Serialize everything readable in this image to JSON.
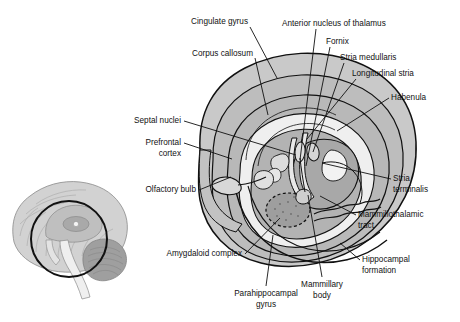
{
  "figure": {
    "background_color": "#ffffff",
    "line_color": "#111111",
    "label_font_size_px": 8.2,
    "palette": {
      "outer_cortex_fill": "#c9c9c9",
      "mid_band_fill": "#bdbdbd",
      "inner_band_fill": "#b3b3b3",
      "thalamus_fill": "#a8a8a8",
      "amygdala_fill": "#9e9e9e",
      "white_fill": "#f2f2f2",
      "inset_brain_fill": "#d2d2d2",
      "inset_deep_fill": "#a9a9a9",
      "inset_circle_stroke": "#111111"
    }
  },
  "inset": {
    "name": "orientation-inset",
    "description": "Mid-sagittal whole brain with circle marking the limbic region"
  },
  "labels": [
    {
      "id": "cingulate-gyrus",
      "text": "Cingulate gyrus",
      "lines": [
        "Cingulate gyrus"
      ],
      "anchor": "end",
      "x": 248,
      "y": 24,
      "leader": [
        [
          250,
          27
        ],
        [
          277,
          78
        ]
      ]
    },
    {
      "id": "anterior-nucleus-of-thalamus",
      "text": "Anterior nucleus of thalamus",
      "lines": [
        "Anterior nucleus of thalamus"
      ],
      "anchor": "start",
      "x": 282,
      "y": 26,
      "leader": [
        [
          316,
          29
        ],
        [
          300,
          160
        ]
      ]
    },
    {
      "id": "corpus-callosum",
      "text": "Corpus callosum",
      "lines": [
        "Corpus callosum"
      ],
      "anchor": "end",
      "x": 253,
      "y": 56,
      "leader": [
        [
          255,
          58
        ],
        [
          268,
          115
        ]
      ]
    },
    {
      "id": "fornix",
      "text": "Fornix",
      "lines": [
        "Fornix"
      ],
      "anchor": "start",
      "x": 326,
      "y": 44,
      "leader": [
        [
          330,
          47
        ],
        [
          306,
          166
        ]
      ]
    },
    {
      "id": "stria-medullaris",
      "text": "Stria medullaris",
      "lines": [
        "Stria medullaris"
      ],
      "anchor": "start",
      "x": 340,
      "y": 60,
      "leader": [
        [
          344,
          63
        ],
        [
          313,
          152
        ]
      ]
    },
    {
      "id": "longitudinal-stria",
      "text": "Longitudinal stria",
      "lines": [
        "Longitudinal stria"
      ],
      "anchor": "start",
      "x": 352,
      "y": 76,
      "leader": [
        [
          356,
          79
        ],
        [
          307,
          139
        ]
      ]
    },
    {
      "id": "habenula",
      "text": "Habenula",
      "lines": [
        "Habenula"
      ],
      "anchor": "start",
      "x": 391,
      "y": 100,
      "leader": [
        [
          389,
          98
        ],
        [
          337,
          131
        ]
      ]
    },
    {
      "id": "septal-nuclei",
      "text": "Septal nuclei",
      "lines": [
        "Septal nuclei"
      ],
      "anchor": "end",
      "x": 181,
      "y": 123,
      "leader": [
        [
          184,
          121
        ],
        [
          296,
          155
        ]
      ]
    },
    {
      "id": "prefrontal-cortex",
      "text": "Prefrontal cortex",
      "lines": [
        "Prefrontal",
        "cortex"
      ],
      "anchor": "end",
      "x": 181,
      "y": 145,
      "leader": [
        [
          184,
          143
        ],
        [
          232,
          159
        ]
      ]
    },
    {
      "id": "stria-terminalis",
      "text": "Stria terminalis",
      "lines": [
        "Stria",
        "terminalis"
      ],
      "anchor": "start",
      "x": 393,
      "y": 181,
      "leader": [
        [
          391,
          179
        ],
        [
          322,
          163
        ]
      ]
    },
    {
      "id": "olfactory-bulb",
      "text": "Olfactory bulb",
      "lines": [
        "Olfactory bulb"
      ],
      "anchor": "end",
      "x": 196,
      "y": 192,
      "leader": [
        [
          199,
          190
        ],
        [
          231,
          177
        ]
      ]
    },
    {
      "id": "mammillothalamic-tract",
      "text": "Mammillothalamic tract",
      "lines": [
        "Mammillothalamic",
        "tract"
      ],
      "anchor": "start",
      "x": 358,
      "y": 217,
      "leader": [
        [
          356,
          215
        ],
        [
          320,
          196
        ]
      ]
    },
    {
      "id": "hippocampal-formation",
      "text": "Hippocampal formation",
      "lines": [
        "Hippocampal",
        "formation"
      ],
      "anchor": "start",
      "x": 362,
      "y": 262,
      "leader": [
        [
          360,
          260
        ],
        [
          340,
          243
        ]
      ]
    },
    {
      "id": "amygdaloid-complex",
      "text": "Amygdaloid complex",
      "lines": [
        "Amygdaloid complex"
      ],
      "anchor": "end",
      "x": 242,
      "y": 256,
      "leader": [
        [
          245,
          254
        ],
        [
          280,
          218
        ]
      ]
    },
    {
      "id": "parahippocampal-gyrus",
      "text": "Parahippocampal gyrus",
      "lines": [
        "Parahippocampal",
        "gyrus"
      ],
      "anchor": "middle",
      "x": 266,
      "y": 296,
      "leader": [
        [
          266,
          286
        ],
        [
          273,
          235
        ]
      ]
    },
    {
      "id": "mammillary-body",
      "text": "Mammillary body",
      "lines": [
        "Mammillary",
        "body"
      ],
      "anchor": "middle",
      "x": 322,
      "y": 287,
      "leader": [
        [
          322,
          277
        ],
        [
          308,
          195
        ]
      ]
    }
  ]
}
